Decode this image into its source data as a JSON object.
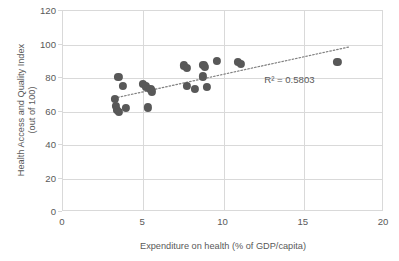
{
  "chart_data": {
    "type": "scatter",
    "title": "",
    "xlabel": "Expenditure on health (% of GDP/capita)",
    "ylabel_line1": "Health Access and Quality Index",
    "ylabel_line2": "(out of 100)",
    "xlim": [
      0,
      20
    ],
    "ylim": [
      0,
      120
    ],
    "xticks": [
      "0",
      "5",
      "10",
      "15",
      "20"
    ],
    "xtick_values": [
      0,
      5,
      10,
      15,
      20
    ],
    "yticks": [
      "0",
      "20",
      "40",
      "60",
      "80",
      "100",
      "120"
    ],
    "ytick_values": [
      0,
      20,
      40,
      60,
      80,
      100,
      120
    ],
    "grid": "both",
    "legend": "none",
    "marker_color": "#585858",
    "grid_color": "#d9d9d9",
    "text_color": "#595959",
    "annotations": [
      {
        "text": "R² = 0.5803",
        "x": 12.6,
        "y": 78
      }
    ],
    "trendline": {
      "type": "linear-dotted",
      "x_start": 3.2,
      "y_start": 68.0,
      "x_end": 17.8,
      "y_end": 98.5,
      "color": "#808080",
      "style": "dotted"
    },
    "points": [
      {
        "x": 3.45,
        "y": 80.5
      },
      {
        "x": 3.75,
        "y": 75.5
      },
      {
        "x": 3.25,
        "y": 67.5
      },
      {
        "x": 3.3,
        "y": 63.5
      },
      {
        "x": 3.35,
        "y": 61.0
      },
      {
        "x": 3.5,
        "y": 60.0
      },
      {
        "x": 3.9,
        "y": 62.0
      },
      {
        "x": 5.3,
        "y": 62.5
      },
      {
        "x": 5.0,
        "y": 76.5
      },
      {
        "x": 5.15,
        "y": 75.0
      },
      {
        "x": 5.45,
        "y": 73.5
      },
      {
        "x": 5.55,
        "y": 72.0
      },
      {
        "x": 7.55,
        "y": 87.5
      },
      {
        "x": 7.7,
        "y": 86.0
      },
      {
        "x": 7.7,
        "y": 75.5
      },
      {
        "x": 8.2,
        "y": 73.5
      },
      {
        "x": 8.7,
        "y": 81.0
      },
      {
        "x": 8.75,
        "y": 88.0
      },
      {
        "x": 8.85,
        "y": 86.5
      },
      {
        "x": 8.95,
        "y": 74.5
      },
      {
        "x": 9.6,
        "y": 90.0
      },
      {
        "x": 10.9,
        "y": 89.5
      },
      {
        "x": 11.1,
        "y": 88.5
      },
      {
        "x": 17.1,
        "y": 89.5
      }
    ]
  }
}
